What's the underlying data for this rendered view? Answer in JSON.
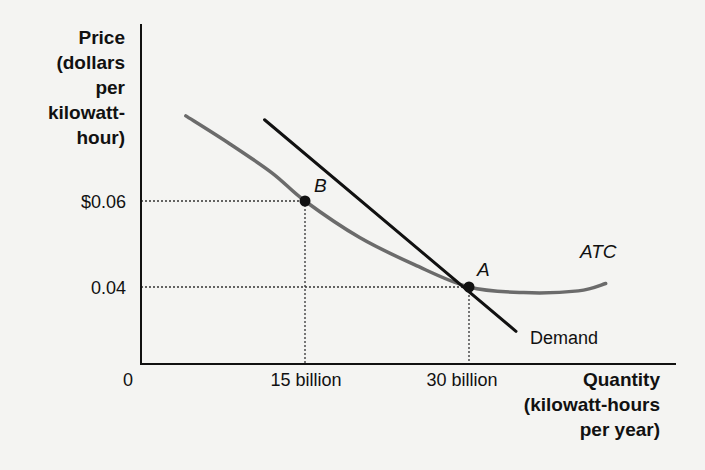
{
  "chart_data": {
    "type": "line",
    "title": "",
    "ylabel_lines": [
      "Price",
      "(dollars",
      "per",
      "kilowatt-",
      "hour)"
    ],
    "xlabel_lines": [
      "Quantity",
      "(kilowatt-hours",
      "per year)"
    ],
    "x_origin_label": "0",
    "x_ticks": [
      {
        "value": 15,
        "label": "15 billion"
      },
      {
        "value": 30,
        "label": "30 billion"
      }
    ],
    "y_ticks": [
      {
        "value": 0.06,
        "label": "$0.06"
      },
      {
        "value": 0.04,
        "label": "0.04"
      }
    ],
    "xlim": [
      0,
      49
    ],
    "ylim": [
      0.0234,
      0.0633
    ],
    "grid": false,
    "series": [
      {
        "name": "ATC",
        "label": "ATC",
        "style": "curve",
        "color": "#6b6b6b",
        "points": [
          [
            4.1,
            0.0798
          ],
          [
            8,
            0.0735
          ],
          [
            12,
            0.0665
          ],
          [
            15,
            0.06
          ],
          [
            20,
            0.0515
          ],
          [
            25,
            0.0452
          ],
          [
            30,
            0.04
          ],
          [
            35,
            0.0387
          ],
          [
            40,
            0.0391
          ],
          [
            42.5,
            0.0408
          ]
        ]
      },
      {
        "name": "Demand",
        "label": "Demand",
        "style": "line",
        "color": "#111111",
        "points": [
          [
            11.3,
            0.0789
          ],
          [
            34.3,
            0.0297
          ]
        ]
      }
    ],
    "points": [
      {
        "name": "B",
        "label": "B",
        "x": 15,
        "y": 0.06
      },
      {
        "name": "A",
        "label": "A",
        "x": 30,
        "y": 0.04
      }
    ],
    "reference_lines": [
      {
        "from": "B",
        "to": "both-axes",
        "style": "dotted"
      },
      {
        "from": "A",
        "to": "both-axes",
        "style": "dotted"
      }
    ]
  }
}
